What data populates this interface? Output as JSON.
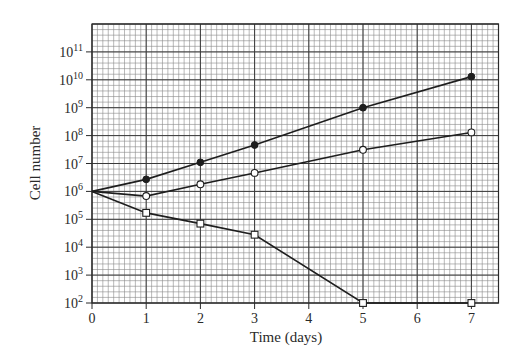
{
  "chart_data": {
    "type": "line",
    "title": "",
    "xlabel": "Time (days)",
    "ylabel": "Cell number",
    "yscale": "log",
    "xlim": [
      0,
      7.5
    ],
    "ylim": [
      100,
      1000000000000
    ],
    "x_ticks": [
      0,
      1,
      2,
      3,
      4,
      5,
      6,
      7
    ],
    "x_tick_labels": [
      "0",
      "1",
      "2",
      "3",
      "4",
      "5",
      "6",
      "7"
    ],
    "y_ticks_exponents": [
      2,
      3,
      4,
      5,
      6,
      7,
      8,
      9,
      10,
      11
    ],
    "y_tick_labels": [
      "10^2",
      "10^3",
      "10^4",
      "10^5",
      "10^6",
      "10^7",
      "10^8",
      "10^9",
      "10^10",
      "10^11"
    ],
    "grid": true,
    "grid_minor": {
      "x_per_day": 10,
      "y_per_decade": 5
    },
    "legend": null,
    "series": [
      {
        "name": "filled circles",
        "marker": "filled-circle",
        "x": [
          0,
          1,
          2,
          3,
          5,
          7
        ],
        "values": [
          1000000,
          2700000,
          11000000,
          46000000,
          1000000000,
          13000000000
        ]
      },
      {
        "name": "open circles",
        "marker": "open-circle",
        "x": [
          0,
          1,
          2,
          3,
          5,
          7
        ],
        "values": [
          1000000,
          680000,
          1800000,
          4600000,
          31000000,
          130000000
        ]
      },
      {
        "name": "open squares",
        "marker": "open-square",
        "x": [
          0,
          1,
          2,
          3,
          5,
          7
        ],
        "values": [
          1000000,
          170000,
          70000,
          28000,
          100,
          100
        ]
      }
    ]
  },
  "colors": {
    "line": "#1e1e1e",
    "grid_minor": "#8a8a8a",
    "grid_major": "#3a3a3a",
    "frame": "#2a2a2a",
    "background": "#ffffff"
  }
}
